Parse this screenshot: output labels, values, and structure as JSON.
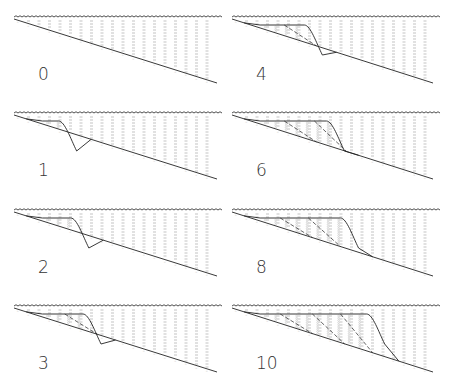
{
  "figure": {
    "type": "stratigraphic-progradation-sequence",
    "colors": {
      "background": "#ffffff",
      "line": "#222222",
      "water_hatch": "#9a9a9a",
      "sediment_fill": "#c8c8c8",
      "label": "#333333"
    },
    "panels": [
      {
        "label": "0",
        "column": 0,
        "row": 0,
        "fronts": []
      },
      {
        "label": "1",
        "column": 0,
        "row": 1,
        "fronts": [
          0.22
        ]
      },
      {
        "label": "2",
        "column": 0,
        "row": 2,
        "fronts": [
          0.28
        ]
      },
      {
        "label": "3",
        "column": 0,
        "row": 3,
        "fronts": [
          0.25,
          0.34
        ]
      },
      {
        "label": "4",
        "column": 1,
        "row": 0,
        "fronts": [
          0.26,
          0.36
        ]
      },
      {
        "label": "6",
        "column": 1,
        "row": 1,
        "fronts": [
          0.26,
          0.41,
          0.47
        ]
      },
      {
        "label": "8",
        "column": 1,
        "row": 2,
        "fronts": [
          0.24,
          0.38,
          0.54
        ]
      },
      {
        "label": "10",
        "column": 1,
        "row": 3,
        "fronts": [
          0.24,
          0.4,
          0.54,
          0.67
        ]
      }
    ]
  }
}
